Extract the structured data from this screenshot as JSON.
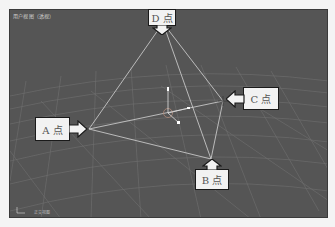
{
  "viewport": {
    "label": "用户视图（透视）",
    "status": "正交视图",
    "background": "#555555",
    "grid_color": "#7a7a7a",
    "edge_color": "#cfcfcf"
  },
  "points": [
    {
      "id": "D",
      "label": "D 点",
      "x": 162,
      "y": 22
    },
    {
      "id": "A",
      "label": "A 点",
      "x": 88,
      "y": 128
    },
    {
      "id": "C",
      "label": "C 点",
      "x": 222,
      "y": 100
    },
    {
      "id": "B",
      "label": "B 点",
      "x": 210,
      "y": 158
    }
  ],
  "callouts": {
    "d": "D 点",
    "a": "A 点",
    "c": "C 点",
    "b": "B 点"
  }
}
